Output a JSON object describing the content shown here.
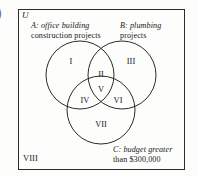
{
  "figure": {
    "marker": ")",
    "universe_label": "U",
    "outside_region_label": "VIII"
  },
  "sets": [
    {
      "id": "A",
      "name": "set-a",
      "prefix": "A",
      "separator": ":",
      "description": "office building construction projects",
      "line1": "A: office building",
      "line2": "construction projects"
    },
    {
      "id": "B",
      "name": "set-b",
      "prefix": "B",
      "separator": ":",
      "description": "plumbing projects",
      "line1": "B: plumbing",
      "line2": "projects"
    },
    {
      "id": "C",
      "name": "set-c",
      "prefix": "C",
      "separator": ":",
      "description": "budget greater than $300,000",
      "line1": "C: budget greater",
      "line2": "than $300,000"
    }
  ],
  "regions": [
    {
      "label": "I",
      "meaning": "A only"
    },
    {
      "label": "II",
      "meaning": "A and B only"
    },
    {
      "label": "III",
      "meaning": "B only"
    },
    {
      "label": "IV",
      "meaning": "A and C only"
    },
    {
      "label": "V",
      "meaning": "A and B and C"
    },
    {
      "label": "VI",
      "meaning": "B and C only"
    },
    {
      "label": "VII",
      "meaning": "C only"
    },
    {
      "label": "VIII",
      "meaning": "outside all sets"
    }
  ],
  "colors": {
    "stroke": "#2b2b2e",
    "text": "#18181a",
    "background": "#fdfdfc"
  }
}
